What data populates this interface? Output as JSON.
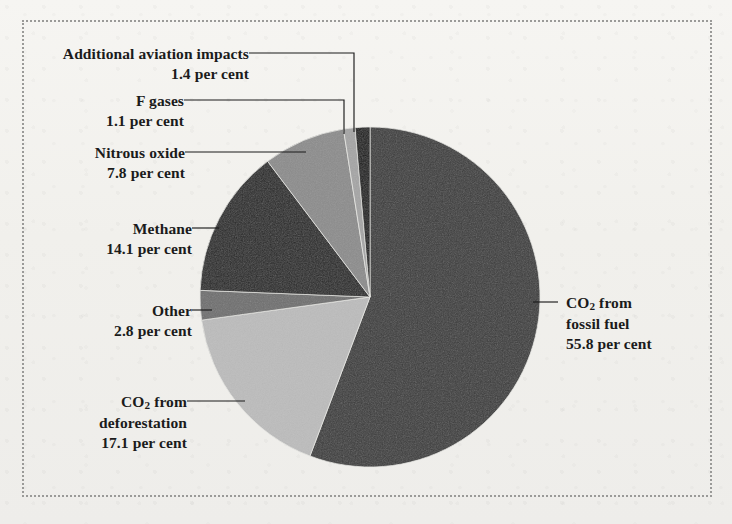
{
  "figure": {
    "background_color": "#f2f1ee",
    "border_style": "dotted",
    "border_color": "#9a9a98"
  },
  "chart_data": {
    "type": "pie",
    "title": "",
    "subtitle": "",
    "xlabel": "",
    "ylabel": "",
    "unit": "per cent",
    "legend_position": "none",
    "start_angle_deg": 0,
    "direction": "clockwise",
    "categories": [
      "CO2 from fossil fuel",
      "CO2 from deforestation",
      "Other",
      "Methane",
      "Nitrous oxide",
      "F gases",
      "Additional aviation impacts"
    ],
    "values": [
      55.8,
      17.1,
      2.8,
      14.1,
      7.8,
      1.1,
      1.4
    ],
    "colors": [
      "#3c3c3c",
      "#bcbcbc",
      "#6f6f6f",
      "#272727",
      "#8c8c8c",
      "#a5a5a5",
      "#141414"
    ],
    "slices": [
      {
        "name": "co2-fossil-fuel",
        "line1": "CO",
        "sub1": "2",
        "line1b": " from",
        "line2": "fossil fuel",
        "line3": "55.8 per cent",
        "value": 55.8,
        "color": "#3c3c3c"
      },
      {
        "name": "co2-deforestation",
        "line1": "CO",
        "sub1": "2",
        "line1b": " from",
        "line2": "deforestation",
        "line3": "17.1 per cent",
        "value": 17.1,
        "color": "#bcbcbc"
      },
      {
        "name": "other",
        "line1": "Other",
        "line3": "2.8 per cent",
        "value": 2.8,
        "color": "#6f6f6f"
      },
      {
        "name": "methane",
        "line1": "Methane",
        "line3": "14.1 per cent",
        "value": 14.1,
        "color": "#272727"
      },
      {
        "name": "nitrous-oxide",
        "line1": "Nitrous oxide",
        "line3": "7.8 per cent",
        "value": 7.8,
        "color": "#8c8c8c"
      },
      {
        "name": "f-gases",
        "line1": "F gases",
        "line3": "1.1 per cent",
        "value": 1.1,
        "color": "#a5a5a5"
      },
      {
        "name": "aviation-impacts",
        "line1": "Additional aviation impacts",
        "line3": "1.4 per cent",
        "value": 1.4,
        "color": "#141414"
      }
    ]
  },
  "labels": {
    "aviation": {
      "title": "Additional aviation impacts",
      "value": "1.4 per cent"
    },
    "fgases": {
      "title": "F gases",
      "value": "1.1 per cent"
    },
    "nitrous": {
      "title": "Nitrous oxide",
      "value": "7.8 per cent"
    },
    "methane": {
      "title": "Methane",
      "value": "14.1 per cent"
    },
    "other": {
      "title": "Other",
      "value": "2.8 per cent"
    },
    "deforestation": {
      "title_pre": "CO",
      "title_sub": "2",
      "title_post": " from",
      "title_line2": "deforestation",
      "value": "17.1 per cent"
    },
    "fossil": {
      "title_pre": "CO",
      "title_sub": "2",
      "title_post": " from",
      "title_line2": "fossil fuel",
      "value": "55.8 per cent"
    }
  }
}
